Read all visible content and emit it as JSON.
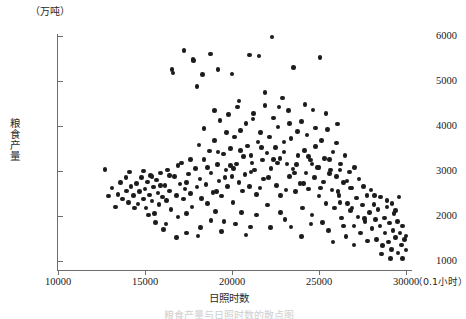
{
  "figure": {
    "caption": "粮食产量与日照时数的散点图",
    "background_color": "#ffffff",
    "point_color": "#1c1c1c",
    "axis_color": "#6d6d6d"
  },
  "chart_data": {
    "type": "scatter",
    "title": "",
    "xlabel": "日照时数",
    "ylabel": "粮食产量",
    "x_unit": "（0.1小时）",
    "y_unit": "（万吨）",
    "xlim": [
      10000,
      30000
    ],
    "ylim": [
      1000,
      6000
    ],
    "xticks": [
      10000,
      15000,
      20000,
      25000,
      30000
    ],
    "yticks": [
      1000,
      2000,
      3000,
      4000,
      5000,
      6000
    ],
    "xticklabels": [
      "10000",
      "15000",
      "20000",
      "25000",
      "30000"
    ],
    "yticklabels": [
      "1000",
      "2000",
      "3000",
      "4000",
      "5000",
      "6000"
    ],
    "grid": false,
    "legend": null,
    "n_points": 292,
    "series": [
      {
        "name": "省份年度观测",
        "marker": "filled-circle",
        "color": "#1c1c1c",
        "points": [
          [
            12700,
            3030
          ],
          [
            13100,
            2620
          ],
          [
            13450,
            2480
          ],
          [
            13700,
            2380
          ],
          [
            13950,
            2560
          ],
          [
            14050,
            2300
          ],
          [
            14200,
            2660
          ],
          [
            14350,
            2450
          ],
          [
            14500,
            2720
          ],
          [
            14600,
            2270
          ],
          [
            14700,
            2540
          ],
          [
            14800,
            2860
          ],
          [
            14900,
            2380
          ],
          [
            15000,
            2600
          ],
          [
            15050,
            2180
          ],
          [
            15150,
            2760
          ],
          [
            15250,
            2470
          ],
          [
            15300,
            2900
          ],
          [
            15400,
            2330
          ],
          [
            15500,
            2640
          ],
          [
            15550,
            2060
          ],
          [
            15650,
            2800
          ],
          [
            15750,
            2510
          ],
          [
            15800,
            2250
          ],
          [
            15900,
            2960
          ],
          [
            16000,
            2420
          ],
          [
            16050,
            1700
          ],
          [
            16150,
            2680
          ],
          [
            16250,
            2340
          ],
          [
            16300,
            3020
          ],
          [
            16400,
            2560
          ],
          [
            16500,
            2150
          ],
          [
            16550,
            5250
          ],
          [
            16600,
            5180
          ],
          [
            16700,
            2880
          ],
          [
            16800,
            2460
          ],
          [
            16900,
            1980
          ],
          [
            17000,
            2710
          ],
          [
            17100,
            3180
          ],
          [
            17200,
            2380
          ],
          [
            17250,
            5680
          ],
          [
            17300,
            2600
          ],
          [
            17400,
            1620
          ],
          [
            17500,
            2930
          ],
          [
            17600,
            2500
          ],
          [
            17700,
            2200
          ],
          [
            17750,
            5480
          ],
          [
            17800,
            5460
          ],
          [
            17900,
            3060
          ],
          [
            18000,
            2640
          ],
          [
            18050,
            1560
          ],
          [
            18150,
            2820
          ],
          [
            18250,
            2390
          ],
          [
            18300,
            5150
          ],
          [
            18400,
            3260
          ],
          [
            18500,
            2700
          ],
          [
            18600,
            2280
          ],
          [
            18700,
            3440
          ],
          [
            18750,
            5600
          ],
          [
            18800,
            2960
          ],
          [
            18900,
            2520
          ],
          [
            19000,
            3680
          ],
          [
            19050,
            2100
          ],
          [
            19150,
            3140
          ],
          [
            19250,
            2780
          ],
          [
            19300,
            4120
          ],
          [
            19400,
            2440
          ],
          [
            19500,
            3380
          ],
          [
            19550,
            1880
          ],
          [
            19650,
            3020
          ],
          [
            19750,
            2660
          ],
          [
            19800,
            4250
          ],
          [
            19900,
            3500
          ],
          [
            20000,
            2880
          ],
          [
            20050,
            2300
          ],
          [
            20150,
            3760
          ],
          [
            20250,
            3160
          ],
          [
            20300,
            4420
          ],
          [
            20400,
            2740
          ],
          [
            20500,
            3900
          ],
          [
            20550,
            2080
          ],
          [
            20650,
            3320
          ],
          [
            20750,
            2920
          ],
          [
            20800,
            4060
          ],
          [
            20900,
            3560
          ],
          [
            21000,
            2660
          ],
          [
            21050,
            1760
          ],
          [
            21150,
            3180
          ],
          [
            21250,
            4280
          ],
          [
            21300,
            3020
          ],
          [
            21400,
            2480
          ],
          [
            21500,
            3640
          ],
          [
            21550,
            5560
          ],
          [
            21650,
            3860
          ],
          [
            21750,
            3240
          ],
          [
            21800,
            2820
          ],
          [
            21900,
            4460
          ],
          [
            22000,
            3400
          ],
          [
            22050,
            2240
          ],
          [
            22150,
            3760
          ],
          [
            22250,
            3060
          ],
          [
            22300,
            5980
          ],
          [
            22400,
            4180
          ],
          [
            22500,
            3520
          ],
          [
            22550,
            2680
          ],
          [
            22650,
            3980
          ],
          [
            22750,
            3280
          ],
          [
            22800,
            2460
          ],
          [
            22900,
            4620
          ],
          [
            23000,
            3640
          ],
          [
            23050,
            1920
          ],
          [
            23150,
            3160
          ],
          [
            23250,
            4340
          ],
          [
            23300,
            2880
          ],
          [
            23400,
            3720
          ],
          [
            23500,
            3040
          ],
          [
            23550,
            5300
          ],
          [
            23650,
            2540
          ],
          [
            23750,
            3880
          ],
          [
            23800,
            3340
          ],
          [
            23900,
            2720
          ],
          [
            24000,
            4100
          ],
          [
            24050,
            2180
          ],
          [
            24150,
            3460
          ],
          [
            24250,
            2960
          ],
          [
            24300,
            3800
          ],
          [
            24400,
            2600
          ],
          [
            24500,
            3240
          ],
          [
            24550,
            1820
          ],
          [
            24650,
            4360
          ],
          [
            24750,
            2860
          ],
          [
            24800,
            3540
          ],
          [
            24900,
            3080
          ],
          [
            25000,
            2440
          ],
          [
            25050,
            5520
          ],
          [
            25150,
            3680
          ],
          [
            25250,
            2760
          ],
          [
            25300,
            3280
          ],
          [
            25400,
            2280
          ],
          [
            25500,
            3920
          ],
          [
            25550,
            1680
          ],
          [
            25650,
            3020
          ],
          [
            25750,
            2580
          ],
          [
            25800,
            3420
          ],
          [
            25900,
            2180
          ],
          [
            26000,
            2880
          ],
          [
            26050,
            4040
          ],
          [
            26150,
            2460
          ],
          [
            26250,
            3160
          ],
          [
            26300,
            1960
          ],
          [
            26400,
            2740
          ],
          [
            26500,
            3340
          ],
          [
            26550,
            1540
          ],
          [
            26650,
            2280
          ],
          [
            26750,
            2980
          ],
          [
            26800,
            2120
          ],
          [
            26900,
            2620
          ],
          [
            27000,
            1780
          ],
          [
            27050,
            3080
          ],
          [
            27150,
            2400
          ],
          [
            27250,
            1980
          ],
          [
            27300,
            2820
          ],
          [
            27400,
            1620
          ],
          [
            27500,
            2240
          ],
          [
            27550,
            2660
          ],
          [
            27650,
            1880
          ],
          [
            27750,
            2460
          ],
          [
            27800,
            1440
          ],
          [
            27900,
            2080
          ],
          [
            28000,
            2580
          ],
          [
            28050,
            1720
          ],
          [
            28150,
            2260
          ],
          [
            28250,
            1920
          ],
          [
            28300,
            1480
          ],
          [
            28400,
            2140
          ],
          [
            28500,
            1780
          ],
          [
            28550,
            2420
          ],
          [
            28650,
            1340
          ],
          [
            28750,
            1960
          ],
          [
            28800,
            1620
          ],
          [
            28900,
            2200
          ],
          [
            29000,
            1420
          ],
          [
            29050,
            1840
          ],
          [
            29150,
            1260
          ],
          [
            29250,
            1680
          ],
          [
            29300,
            2060
          ],
          [
            29400,
            1520
          ],
          [
            29500,
            1880
          ],
          [
            29550,
            1180
          ],
          [
            29650,
            1620
          ],
          [
            29750,
            1360
          ],
          [
            29800,
            1780
          ],
          [
            29900,
            1480
          ],
          [
            30000,
            1240
          ],
          [
            15200,
            2020
          ],
          [
            15600,
            1860
          ],
          [
            16200,
            1820
          ],
          [
            16800,
            1520
          ],
          [
            17400,
            2060
          ],
          [
            18200,
            1740
          ],
          [
            18800,
            1900
          ],
          [
            19400,
            1660
          ],
          [
            20200,
            1820
          ],
          [
            20800,
            1580
          ],
          [
            21400,
            2020
          ],
          [
            22200,
            1740
          ],
          [
            22800,
            2080
          ],
          [
            23400,
            1760
          ],
          [
            24000,
            1540
          ],
          [
            24600,
            2020
          ],
          [
            25200,
            1860
          ],
          [
            25800,
            1420
          ],
          [
            26400,
            1780
          ],
          [
            27000,
            1360
          ],
          [
            19100,
            2540
          ],
          [
            19600,
            2860
          ],
          [
            20100,
            3060
          ],
          [
            20600,
            2560
          ],
          [
            21100,
            2980
          ],
          [
            21600,
            2620
          ],
          [
            22100,
            2860
          ],
          [
            22600,
            3180
          ],
          [
            23100,
            2580
          ],
          [
            23600,
            2960
          ],
          [
            24100,
            2720
          ],
          [
            24600,
            3160
          ],
          [
            25100,
            2620
          ],
          [
            25600,
            2940
          ],
          [
            26100,
            2540
          ],
          [
            26600,
            2780
          ],
          [
            18400,
            3940
          ],
          [
            19000,
            4340
          ],
          [
            19700,
            3860
          ],
          [
            20400,
            4560
          ],
          [
            21200,
            4160
          ],
          [
            21900,
            4740
          ],
          [
            22700,
            4420
          ],
          [
            23300,
            4060
          ],
          [
            24200,
            4480
          ],
          [
            24800,
            3960
          ],
          [
            25400,
            4280
          ],
          [
            26000,
            3620
          ],
          [
            17600,
            3260
          ],
          [
            18100,
            3580
          ],
          [
            18600,
            3080
          ],
          [
            19200,
            3420
          ],
          [
            19900,
            3120
          ],
          [
            20500,
            3460
          ],
          [
            21100,
            3340
          ],
          [
            21700,
            3520
          ],
          [
            22400,
            3260
          ],
          [
            23000,
            3420
          ],
          [
            23700,
            3140
          ],
          [
            24400,
            3320
          ],
          [
            25000,
            3080
          ],
          [
            25600,
            3260
          ],
          [
            26200,
            3020
          ],
          [
            26800,
            2620
          ],
          [
            13900,
            2860
          ],
          [
            14400,
            2180
          ],
          [
            14900,
            3000
          ],
          [
            15400,
            2880
          ],
          [
            15900,
            2680
          ],
          [
            16400,
            2900
          ],
          [
            16900,
            3120
          ],
          [
            17400,
            2740
          ],
          [
            13300,
            2200
          ],
          [
            13600,
            2740
          ],
          [
            12900,
            2440
          ],
          [
            14100,
            2980
          ],
          [
            21000,
            5580
          ],
          [
            20000,
            5160
          ],
          [
            19200,
            5260
          ],
          [
            18000,
            4880
          ],
          [
            26200,
            2300
          ],
          [
            26900,
            2180
          ],
          [
            27600,
            1940
          ],
          [
            28200,
            2460
          ],
          [
            28900,
            2340
          ],
          [
            29400,
            2120
          ],
          [
            28600,
            1160
          ],
          [
            29100,
            1060
          ],
          [
            29800,
            1060
          ],
          [
            30000,
            1560
          ],
          [
            29600,
            2420
          ],
          [
            29200,
            2280
          ]
        ]
      }
    ]
  },
  "axes": {
    "y_unit_label": "（万吨）",
    "y_title": "粮食产量",
    "x_title": "日照时数",
    "x_unit_label": "（0.1小时）",
    "y_tick_labels": [
      "6000",
      "5000",
      "4000",
      "3000",
      "2000",
      "1000"
    ],
    "x_tick_labels": [
      "10000",
      "15000",
      "20000",
      "25000",
      "30000"
    ]
  }
}
